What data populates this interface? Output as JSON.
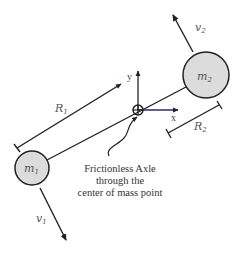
{
  "diagram": {
    "type": "rotating-two-mass-system",
    "masses": [
      {
        "id": "m1",
        "label": "m",
        "subscript": "1",
        "fill": "#dcdcdc"
      },
      {
        "id": "m2",
        "label": "m",
        "subscript": "2",
        "fill": "#dcdcdc"
      }
    ],
    "velocities": [
      {
        "id": "v1",
        "label": "v",
        "subscript": "1"
      },
      {
        "id": "v2",
        "label": "v",
        "subscript": "2"
      }
    ],
    "radii": [
      {
        "id": "R1",
        "label": "R",
        "subscript": "1"
      },
      {
        "id": "R2",
        "label": "R",
        "subscript": "2"
      }
    ],
    "axes": {
      "x_label": "x",
      "y_label": "y"
    },
    "caption": {
      "line1": "Frictionless Axle",
      "line2": "through the",
      "line3": "center of mass point"
    },
    "colors": {
      "line": "#222222",
      "mass_fill": "#dcdcdc",
      "text": "#333333",
      "x_axis": "#2a2a6a"
    }
  }
}
